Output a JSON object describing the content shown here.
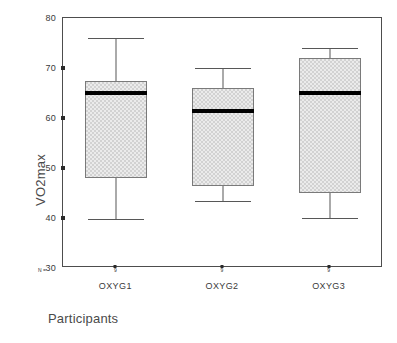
{
  "chart_data": {
    "type": "box",
    "title": "",
    "xlabel": "Participants",
    "ylabel": "VO2max",
    "ylim": [
      30,
      80
    ],
    "yticks": [
      30,
      40,
      50,
      60,
      70,
      80
    ],
    "ytick_labels": [
      "30",
      "40",
      "50",
      "60",
      "70",
      "80"
    ],
    "grid": false,
    "legend": "none",
    "categories": [
      "OXYG1",
      "OXYG2",
      "OXYG3"
    ],
    "n_caption": "N =",
    "n_values": [
      "9",
      "9",
      "9"
    ],
    "boxes": [
      {
        "category": "OXYG1",
        "whisker_low": 39.8,
        "q1": 48.0,
        "median": 65.0,
        "q3": 67.5,
        "whisker_high": 76.0,
        "n": 9
      },
      {
        "category": "OXYG2",
        "whisker_low": 43.5,
        "q1": 46.5,
        "median": 61.5,
        "q3": 66.0,
        "whisker_high": 70.0,
        "n": 9
      },
      {
        "category": "OXYG3",
        "whisker_low": 40.0,
        "q1": 45.0,
        "median": 65.0,
        "q3": 72.0,
        "whisker_high": 74.0,
        "n": 9
      }
    ],
    "colors": {
      "box_fill": "#d2d2d2",
      "box_border": "#7a7a7a",
      "median": "#000000",
      "whisker": "#575757",
      "axis": "#4d4d4d",
      "text": "#3a3a3a",
      "background": "#ffffff"
    }
  }
}
